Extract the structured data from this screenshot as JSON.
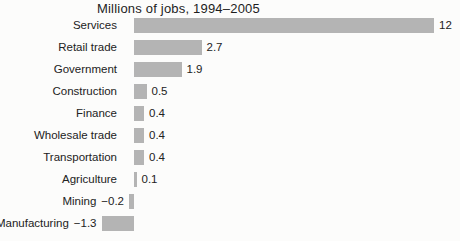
{
  "chart_data": {
    "type": "bar",
    "orientation": "horizontal",
    "title": "Millions of jobs, 1994–2005",
    "categories": [
      "Services",
      "Retail trade",
      "Government",
      "Construction",
      "Finance",
      "Wholesale trade",
      "Transportation",
      "Agriculture",
      "Mining",
      "Manufacturing"
    ],
    "values": [
      12,
      2.7,
      1.9,
      0.5,
      0.4,
      0.4,
      0.4,
      0.1,
      -0.2,
      -1.3
    ],
    "value_labels": [
      "12",
      "2.7",
      "1.9",
      "0.5",
      "0.4",
      "0.4",
      "0.4",
      "0.1",
      "−0.2",
      "−1.3"
    ],
    "xlabel": "",
    "ylabel": "",
    "xlim": [
      -1.5,
      12.5
    ],
    "grid": false,
    "legend": false,
    "bar_color": "#b4b4b4",
    "text_color": "#222222",
    "background_color": "#fcfcfb"
  }
}
